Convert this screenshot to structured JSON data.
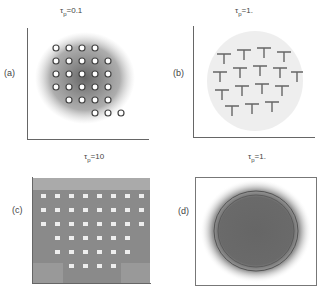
{
  "figure": {
    "panels": [
      {
        "id": "a",
        "label": "(a)",
        "title_sym": "τ",
        "title_sub": "p",
        "title_val": "=0.1",
        "pattern": "square lattice of circles with connecting trajectories, dense center"
      },
      {
        "id": "b",
        "label": "(b)",
        "title_sym": "τ",
        "title_sub": "p",
        "title_val": "=1.",
        "pattern": "interlocking T-shaped trajectory lattice"
      },
      {
        "id": "c",
        "label": "(c)",
        "title_sym": "τ",
        "title_sub": "p",
        "title_val": "=10",
        "pattern": "dense noisy grid with light square holes"
      },
      {
        "id": "d",
        "label": "(d)",
        "title_sym": "τ",
        "title_sub": "p",
        "title_val": "=1.",
        "pattern": "dense circular scatter cloud"
      }
    ]
  }
}
